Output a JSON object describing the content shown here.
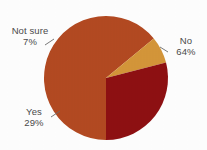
{
  "chart_data": {
    "type": "pie",
    "title": "",
    "subtitle": "",
    "xlabel": "",
    "ylabel": "",
    "legend_position": "none",
    "grid": false,
    "labels_inside": false,
    "start_angle_deg": 180,
    "direction": "clockwise",
    "categories": [
      "No",
      "Yes",
      "Not sure"
    ],
    "values": [
      64,
      29,
      7
    ],
    "unit": "%",
    "slices": [
      {
        "label": "No",
        "value": 64,
        "display_value": "64%",
        "color": "#B34A22",
        "start_angle_deg": 180,
        "end_angle_deg": 410.4,
        "sweep_deg": 230.4
      },
      {
        "label": "Not sure",
        "value": 7,
        "display_value": "7%",
        "color": "#D4963A",
        "start_angle_deg": 410.4,
        "end_angle_deg": 435.6,
        "sweep_deg": 25.2
      },
      {
        "label": "Yes",
        "value": 29,
        "display_value": "29%",
        "color": "#8E1012",
        "start_angle_deg": 435.6,
        "end_angle_deg": 540,
        "sweep_deg": 104.4
      }
    ]
  },
  "labels": {
    "no": {
      "name": "No",
      "percent": "64%"
    },
    "yes": {
      "name": "Yes",
      "percent": "29%"
    },
    "not_sure": {
      "name": "Not sure",
      "percent": "7%"
    }
  },
  "colors": {
    "background": "#ffffff",
    "text": "#4a4a4a",
    "leader_line": "#6b6b6b",
    "slice_no": "#B34A22",
    "slice_yes": "#8E1012",
    "slice_not_sure": "#D4963A"
  },
  "geometry": {
    "center_x": 106,
    "center_y": 78,
    "radius": 62
  }
}
